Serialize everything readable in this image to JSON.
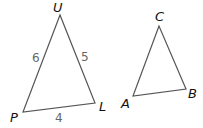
{
  "figure": {
    "triangle_1": {
      "vertices": {
        "top": "U",
        "left": "P",
        "right": "L"
      },
      "sides": {
        "PU": "6",
        "UL": "5",
        "PL": "4"
      }
    },
    "triangle_2": {
      "vertices": {
        "top": "C",
        "left": "A",
        "right": "B"
      }
    },
    "colors": {
      "stroke": "#555555",
      "vertex_label": "#111111",
      "side_label": "#666666"
    }
  }
}
